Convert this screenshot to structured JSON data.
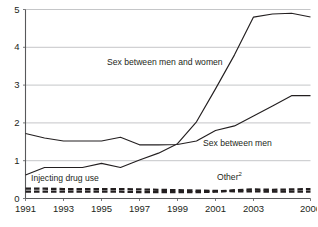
{
  "chart_data": {
    "type": "line",
    "title": "",
    "subtitle": "",
    "xlabel": "",
    "ylabel": "",
    "xlim": [
      1991,
      2006
    ],
    "ylim": [
      0,
      5
    ],
    "grid": true,
    "legend_position": "inline-annotations",
    "y_ticks": [
      "0",
      "1",
      "2",
      "3",
      "4",
      "5"
    ],
    "y_tick_values": [
      0,
      1,
      2,
      3,
      4,
      5
    ],
    "x_ticks": [
      "1991",
      "1993",
      "1995",
      "1997",
      "1999",
      "2001",
      "2003",
      "2006"
    ],
    "x_tick_values": [
      1991,
      1993,
      1995,
      1997,
      1999,
      2001,
      2003,
      2006
    ],
    "x": [
      1991,
      1992,
      1993,
      1994,
      1995,
      1996,
      1997,
      1998,
      1999,
      2000,
      2001,
      2002,
      2003,
      2004,
      2005,
      2006
    ],
    "series": [
      {
        "name": "Sex between men and women",
        "style": "solid",
        "color": "#231f20",
        "values": [
          0.62,
          0.82,
          0.82,
          0.82,
          0.93,
          0.82,
          1.02,
          1.2,
          1.45,
          2.03,
          2.9,
          3.8,
          4.8,
          4.88,
          4.9,
          4.8
        ]
      },
      {
        "name": "Sex between men",
        "style": "solid",
        "color": "#231f20",
        "values": [
          1.72,
          1.6,
          1.52,
          1.52,
          1.52,
          1.62,
          1.42,
          1.42,
          1.43,
          1.52,
          1.8,
          1.92,
          2.18,
          2.45,
          2.72,
          2.72
        ]
      },
      {
        "name": "Injecting drug use",
        "style": "dashed",
        "color": "#231f20",
        "values": [
          0.26,
          0.26,
          0.25,
          0.25,
          0.25,
          0.25,
          0.24,
          0.23,
          0.22,
          0.21,
          0.2,
          0.19,
          0.19,
          0.18,
          0.18,
          0.18
        ]
      },
      {
        "name": "Other",
        "style": "dashed",
        "color": "#231f20",
        "note_marker": "2",
        "values": [
          0.18,
          0.18,
          0.18,
          0.18,
          0.18,
          0.18,
          0.17,
          0.17,
          0.17,
          0.17,
          0.18,
          0.22,
          0.24,
          0.23,
          0.24,
          0.25
        ]
      }
    ],
    "annotations": [
      {
        "text": "Sex between men and women",
        "superscript": ""
      },
      {
        "text": "Sex between men",
        "superscript": ""
      },
      {
        "text": "Injecting drug use",
        "superscript": ""
      },
      {
        "text": "Other",
        "superscript": "2"
      }
    ]
  },
  "colors": {
    "line": "#231f20",
    "grid": "#b6b8ba",
    "axis": "#58595b",
    "background": "#ffffff"
  }
}
